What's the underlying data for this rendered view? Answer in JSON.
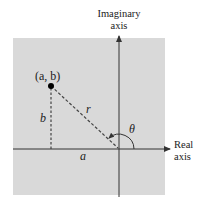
{
  "diagram": {
    "type": "complex-plane-polar",
    "labels": {
      "imag_axis_line1": "Imaginary",
      "imag_axis_line2": "axis",
      "real_axis_line1": "Real",
      "real_axis_line2": "axis",
      "point": "(a, b)",
      "a": "a",
      "b": "b",
      "r": "r",
      "theta": "θ"
    },
    "colors": {
      "plane": "#d9d9d9",
      "axes": "#333333",
      "dashes": "#444444",
      "point": "#000000",
      "text": "#222222"
    }
  }
}
